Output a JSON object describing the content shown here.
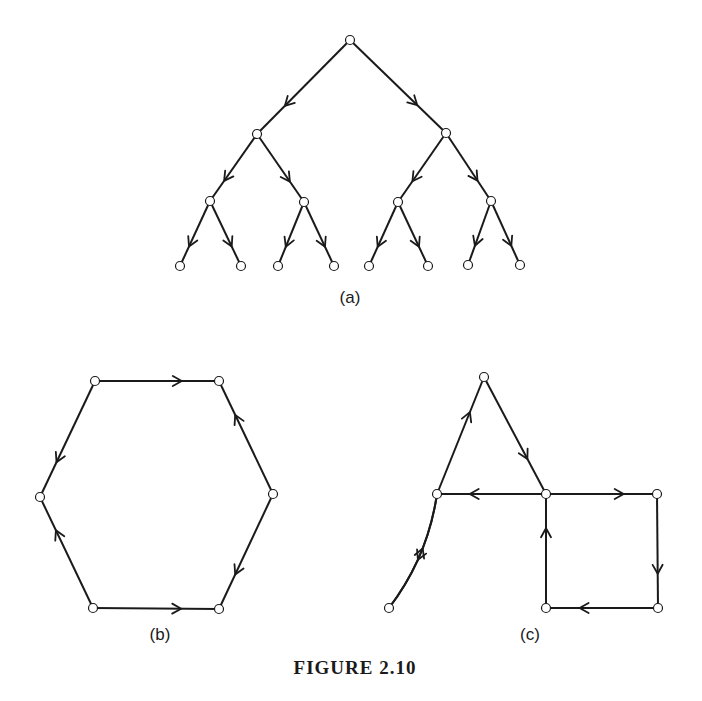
{
  "figure": {
    "caption": "FIGURE 2.10",
    "panels": [
      {
        "id": "a",
        "label": "(a)",
        "type": "directed-binary-tree",
        "label_pos": [
          350,
          303
        ],
        "nodes": [
          [
            350,
            40
          ],
          [
            257,
            134
          ],
          [
            446,
            133
          ],
          [
            210,
            201
          ],
          [
            304,
            202
          ],
          [
            398,
            202
          ],
          [
            491,
            201
          ],
          [
            180,
            266
          ],
          [
            241,
            266
          ],
          [
            278,
            266
          ],
          [
            334,
            266
          ],
          [
            369,
            266
          ],
          [
            428,
            266
          ],
          [
            468,
            265
          ],
          [
            520,
            265
          ]
        ],
        "edges": [
          [
            0,
            1
          ],
          [
            0,
            2
          ],
          [
            1,
            3
          ],
          [
            1,
            4
          ],
          [
            2,
            5
          ],
          [
            2,
            6
          ],
          [
            3,
            7
          ],
          [
            3,
            8
          ],
          [
            4,
            9
          ],
          [
            4,
            10
          ],
          [
            5,
            11
          ],
          [
            5,
            12
          ],
          [
            6,
            13
          ],
          [
            6,
            14
          ]
        ]
      },
      {
        "id": "b",
        "label": "(b)",
        "type": "directed-hexagon",
        "label_pos": [
          160,
          640
        ],
        "nodes": [
          [
            95,
            381
          ],
          [
            219,
            381
          ],
          [
            273,
            494
          ],
          [
            219,
            609
          ],
          [
            93,
            608
          ],
          [
            40,
            497
          ]
        ],
        "edges": [
          [
            0,
            1
          ],
          [
            2,
            1
          ],
          [
            2,
            3
          ],
          [
            4,
            3
          ],
          [
            4,
            5
          ],
          [
            0,
            5
          ]
        ]
      },
      {
        "id": "c",
        "label": "(c)",
        "type": "directed-graph",
        "label_pos": [
          530,
          640
        ],
        "nodes": [
          [
            484,
            377
          ],
          [
            437,
            494
          ],
          [
            546,
            494
          ],
          [
            657,
            494
          ],
          [
            389,
            608
          ],
          [
            546,
            608
          ],
          [
            658,
            608
          ]
        ],
        "edges": [
          [
            1,
            0
          ],
          [
            0,
            2
          ],
          [
            2,
            1
          ],
          [
            2,
            3
          ],
          [
            3,
            6
          ],
          [
            6,
            5
          ],
          [
            5,
            2
          ]
        ],
        "curved_edges": [
          {
            "from": 4,
            "to": 1,
            "bend": "left"
          },
          {
            "from": 1,
            "to": 4,
            "bend": "right"
          }
        ]
      }
    ]
  }
}
